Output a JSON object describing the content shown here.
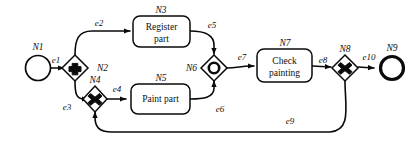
{
  "diagram": {
    "type": "bpmn-process-diagram",
    "background_color": "#ffffff",
    "line_color": "#0a0a0a"
  },
  "nodes": [
    {
      "id": "N1",
      "label": "N1",
      "kind": "start-event",
      "shape": "circle-thin",
      "text": ""
    },
    {
      "id": "N2",
      "label": "N2",
      "kind": "and-gateway",
      "shape": "diamond-plus",
      "text": ""
    },
    {
      "id": "N3",
      "label": "N3",
      "kind": "task",
      "shape": "rounded-rect",
      "text": "Register part",
      "line1": "Register",
      "line2": "part"
    },
    {
      "id": "N4",
      "label": "N4",
      "kind": "xor-gateway",
      "shape": "diamond-cross",
      "text": ""
    },
    {
      "id": "N5",
      "label": "N5",
      "kind": "task",
      "shape": "rounded-rect",
      "text": "Paint part",
      "line1": "Paint part",
      "line2": ""
    },
    {
      "id": "N6",
      "label": "N6",
      "kind": "or-gateway",
      "shape": "diamond-circle",
      "text": ""
    },
    {
      "id": "N7",
      "label": "N7",
      "kind": "task",
      "shape": "rounded-rect",
      "text": "Check painting",
      "line1": "Check",
      "line2": "painting"
    },
    {
      "id": "N8",
      "label": "N8",
      "kind": "xor-gateway",
      "shape": "diamond-cross",
      "text": ""
    },
    {
      "id": "N9",
      "label": "N9",
      "kind": "end-event",
      "shape": "circle-thick",
      "text": ""
    }
  ],
  "edges": [
    {
      "id": "e1",
      "label": "e1",
      "from": "N1",
      "to": "N2"
    },
    {
      "id": "e2",
      "label": "e2",
      "from": "N2",
      "to": "N3"
    },
    {
      "id": "e3",
      "label": "e3",
      "from": "N2",
      "to": "N4"
    },
    {
      "id": "e4",
      "label": "e4",
      "from": "N4",
      "to": "N5"
    },
    {
      "id": "e5",
      "label": "e5",
      "from": "N3",
      "to": "N6"
    },
    {
      "id": "e6",
      "label": "e6",
      "from": "N5",
      "to": "N6"
    },
    {
      "id": "e7",
      "label": "e7",
      "from": "N6",
      "to": "N7"
    },
    {
      "id": "e8",
      "label": "e8",
      "from": "N7",
      "to": "N8"
    },
    {
      "id": "e9",
      "label": "e9",
      "from": "N8",
      "to": "N4"
    },
    {
      "id": "e10",
      "label": "e10",
      "from": "N8",
      "to": "N9"
    }
  ]
}
